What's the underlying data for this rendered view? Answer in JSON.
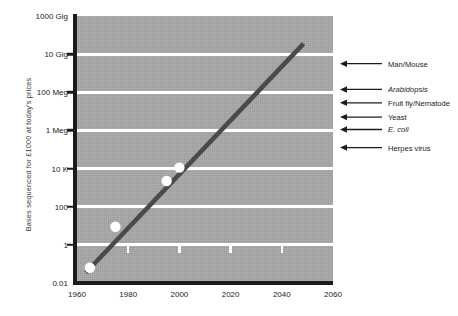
{
  "chart_data": {
    "type": "line",
    "title": "",
    "subtitle": "",
    "xlabel": "",
    "ylabel": "Bases sequenced for £1000 at today's prices",
    "xlim": [
      1960,
      2060
    ],
    "ylim_log10": [
      -2,
      12
    ],
    "grid": true,
    "legend_position": "none",
    "background_color": "#a8a8a8",
    "gridline_color": "#ffffff",
    "series_color": "#4a4a4a",
    "marker_color": "#ffffff",
    "axis_color": "#1c1c1c",
    "x_ticks": [
      {
        "label": "1960",
        "value": 1960
      },
      {
        "label": "1980",
        "value": 1980
      },
      {
        "label": "2000",
        "value": 2000
      },
      {
        "label": "2020",
        "value": 2020
      },
      {
        "label": "2040",
        "value": 2040
      },
      {
        "label": "2060",
        "value": 2060
      }
    ],
    "x_tick_marks": [
      1980,
      2000,
      2020,
      2040
    ],
    "y_ticks": [
      {
        "label": "1000 Gig",
        "log10": 12
      },
      {
        "label": "10 Gig",
        "log10": 10
      },
      {
        "label": "100 Meg",
        "log10": 8
      },
      {
        "label": "1 Meg",
        "log10": 6
      },
      {
        "label": "10 K",
        "log10": 4
      },
      {
        "label": "100",
        "log10": 2
      },
      {
        "label": "1",
        "log10": 0
      },
      {
        "label": "0.01",
        "log10": -2
      }
    ],
    "gridlines_log10": [
      10,
      8,
      6,
      4,
      2,
      0
    ],
    "trend_line": {
      "start": {
        "x": 1963.5,
        "log10_y": -1.45
      },
      "end": {
        "x": 2048.5,
        "log10_y": 10.55
      }
    },
    "points": [
      {
        "x": 1965,
        "log10_y": -1.2,
        "value": "0.06"
      },
      {
        "x": 1975,
        "log10_y": 0.95,
        "value": "9"
      },
      {
        "x": 1995,
        "log10_y": 3.35,
        "value": "2200"
      },
      {
        "x": 2000,
        "log10_y": 4.05,
        "value": "11000"
      }
    ],
    "annotations": [
      {
        "label": "Man/Mouse",
        "log10_y": 9.5,
        "italic": false
      },
      {
        "label": "Arabidopsis",
        "log10_y": 8.15,
        "italic": true
      },
      {
        "label": "Fruit fly/Nematode",
        "log10_y": 7.45,
        "italic": false
      },
      {
        "label": "Yeast",
        "log10_y": 6.7,
        "italic": false
      },
      {
        "label": "E. coli",
        "log10_y": 6.05,
        "italic": true
      },
      {
        "label": "Herpes virus",
        "log10_y": 5.1,
        "italic": false
      }
    ]
  }
}
